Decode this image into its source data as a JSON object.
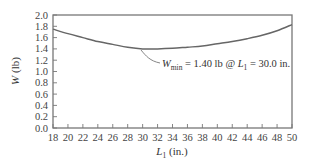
{
  "chart_data": {
    "type": "line",
    "title": "",
    "xlabel": "L1 (in.)",
    "xlabel_main": "L",
    "xlabel_sub": "1",
    "xlabel_unit": " (in.)",
    "ylabel": "W (lb)",
    "xlim": [
      18,
      50
    ],
    "ylim": [
      0.0,
      2.0
    ],
    "xticks": [
      "18",
      "20",
      "22",
      "24",
      "26",
      "28",
      "30",
      "32",
      "34",
      "36",
      "38",
      "40",
      "42",
      "44",
      "46",
      "48",
      "50"
    ],
    "yticks": [
      "0.0",
      "0.2",
      "0.4",
      "0.6",
      "0.8",
      "1.0",
      "1.2",
      "1.4",
      "1.6",
      "1.8",
      "2.0"
    ],
    "grid": false,
    "legend": null,
    "series": [
      {
        "name": "W",
        "x": [
          18,
          20,
          22,
          24,
          26,
          28,
          30,
          32,
          34,
          36,
          38,
          40,
          42,
          44,
          46,
          48,
          50
        ],
        "values": [
          1.75,
          1.67,
          1.6,
          1.53,
          1.48,
          1.43,
          1.4,
          1.4,
          1.41,
          1.43,
          1.45,
          1.49,
          1.53,
          1.58,
          1.64,
          1.72,
          1.83
        ]
      }
    ],
    "annotations": [
      {
        "text": "W_min = 1.40 lb @ L1 = 30.0 in.",
        "point": {
          "x": 30.0,
          "y": 1.4
        },
        "parts": {
          "w": "W",
          "wsub": "min",
          "mid": " = 1.40 lb @ ",
          "l": "L",
          "lsub": "1",
          "end": " = 30.0 in."
        }
      }
    ],
    "colors": {
      "curve": "#666666",
      "frame": "#777777",
      "text": "#333333"
    }
  }
}
